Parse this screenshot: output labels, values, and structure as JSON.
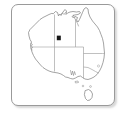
{
  "widget": {
    "name": "australia-locator-map",
    "title": "Australia",
    "frame_border_color": "#9a9a9a",
    "background_color": "#ffffff"
  },
  "map": {
    "region": "Australia",
    "projection_note": "locator thumbnail",
    "coastline_color": "#7d7d7d",
    "border_color": "#9d9d9d",
    "fill_color": "#ffffff",
    "landmasses": [
      {
        "name": "mainland-australia"
      },
      {
        "name": "tasmania"
      }
    ],
    "state_boundaries": [
      {
        "name": "western-australia"
      },
      {
        "name": "northern-territory"
      },
      {
        "name": "south-australia"
      },
      {
        "name": "queensland"
      },
      {
        "name": "new-south-wales"
      },
      {
        "name": "victoria"
      },
      {
        "name": "australian-capital-territory"
      }
    ]
  },
  "markers": [
    {
      "id": "location-marker-1",
      "shape": "square",
      "color": "#161616",
      "size_px": 4,
      "x_pct": 45.0,
      "y_pct": 32.0,
      "label": ""
    }
  ]
}
